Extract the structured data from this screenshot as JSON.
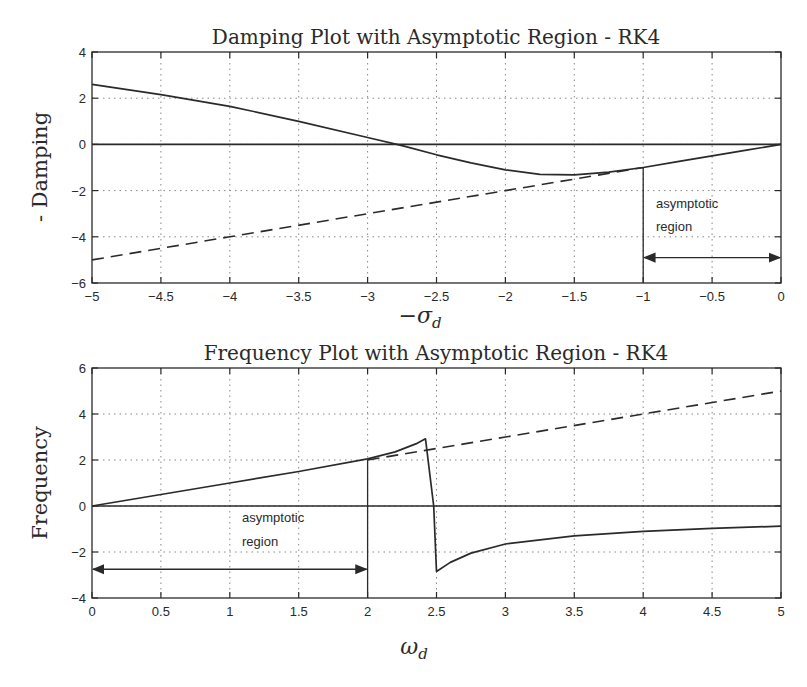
{
  "chart_data": [
    {
      "type": "line",
      "title": "Damping Plot with Asymptotic Region - RK4",
      "xlabel": "-σ_d",
      "ylabel": "- Damping",
      "xlim": [
        -5,
        0
      ],
      "ylim": [
        -6,
        4
      ],
      "xticks": [
        -5,
        -4.5,
        -4,
        -3.5,
        -3,
        -2.5,
        -2,
        -1.5,
        -1,
        -0.5,
        0
      ],
      "xtick_labels": [
        "-5",
        "-4.5",
        "-4",
        "-3.5",
        "-3",
        "-2.5",
        "-2",
        "-1.5",
        "-1",
        "-0.5",
        "0"
      ],
      "yticks": [
        -6,
        -4,
        -2,
        0,
        2,
        4
      ],
      "ytick_labels": [
        "-6",
        "-4",
        "-2",
        "0",
        "2",
        "4"
      ],
      "grid": true,
      "series": [
        {
          "name": "RK4 damping",
          "style": "solid",
          "x": [
            -5,
            -4.5,
            -4,
            -3.5,
            -3,
            -2.75,
            -2.5,
            -2.25,
            -2,
            -1.75,
            -1.5,
            -1.25,
            -1,
            -0.75,
            -0.5,
            -0.25,
            0
          ],
          "y": [
            2.6,
            2.15,
            1.65,
            1.0,
            0.3,
            -0.05,
            -0.45,
            -0.8,
            -1.1,
            -1.3,
            -1.32,
            -1.2,
            -1.0,
            -0.75,
            -0.5,
            -0.25,
            0
          ]
        },
        {
          "name": "Asymptote",
          "style": "dashed",
          "x": [
            -5,
            -4,
            -3,
            -2,
            -1.5,
            -1
          ],
          "y": [
            -5,
            -4,
            -3,
            -2,
            -1.5,
            -1
          ]
        },
        {
          "name": "Zero line",
          "style": "solid",
          "x": [
            -5,
            0
          ],
          "y": [
            0,
            0
          ]
        }
      ],
      "annotations": [
        {
          "text": "asymptotic",
          "x": -0.93,
          "y": -2.8
        },
        {
          "text": "region",
          "x": -0.93,
          "y": -3.8
        },
        {
          "type": "vline",
          "x": -1,
          "y_range": [
            -6,
            -1
          ]
        },
        {
          "type": "double-arrow",
          "x_range": [
            -1,
            0
          ],
          "y": -4.9
        }
      ]
    },
    {
      "type": "line",
      "title": "Frequency Plot with Asymptotic Region - RK4",
      "xlabel": "ω_d",
      "ylabel": "Frequency",
      "xlim": [
        0,
        5
      ],
      "ylim": [
        -4,
        6
      ],
      "xticks": [
        0,
        0.5,
        1,
        1.5,
        2,
        2.5,
        3,
        3.5,
        4,
        4.5,
        5
      ],
      "xtick_labels": [
        "0",
        "0.5",
        "1",
        "1.5",
        "2",
        "2.5",
        "3",
        "3.5",
        "4",
        "4.5",
        "5"
      ],
      "yticks": [
        -4,
        -2,
        0,
        2,
        4,
        6
      ],
      "ytick_labels": [
        "-4",
        "-2",
        "0",
        "2",
        "4",
        "6"
      ],
      "grid": true,
      "series": [
        {
          "name": "RK4 frequency",
          "style": "solid",
          "x": [
            0,
            0.5,
            1,
            1.5,
            2,
            2.2,
            2.35,
            2.42,
            2.48,
            2.5,
            2.6,
            2.75,
            3,
            3.5,
            4,
            4.5,
            5
          ],
          "y": [
            0,
            0.5,
            1.0,
            1.5,
            2.05,
            2.35,
            2.7,
            2.92,
            0,
            -2.85,
            -2.45,
            -2.05,
            -1.65,
            -1.3,
            -1.1,
            -0.97,
            -0.88
          ]
        },
        {
          "name": "Asymptote",
          "style": "dashed",
          "x": [
            2,
            3,
            4,
            5
          ],
          "y": [
            2,
            3,
            4,
            5
          ]
        },
        {
          "name": "Zero line",
          "style": "solid",
          "x": [
            0,
            5
          ],
          "y": [
            0,
            0
          ]
        }
      ],
      "annotations": [
        {
          "text": "asymptotic",
          "x": 1.1,
          "y": -0.7
        },
        {
          "text": "region",
          "x": 1.1,
          "y": -1.7
        },
        {
          "type": "vline",
          "x": 2,
          "y_range": [
            -4,
            2
          ]
        },
        {
          "type": "double-arrow",
          "x_range": [
            0,
            2
          ],
          "y": -2.75
        }
      ]
    }
  ]
}
